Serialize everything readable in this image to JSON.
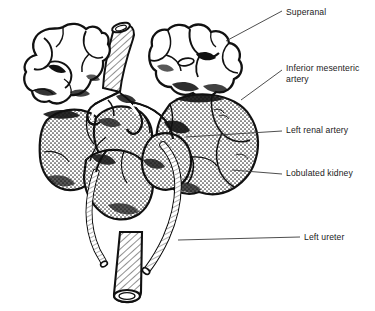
{
  "figure": {
    "background_color": "#ffffff",
    "ink_color": "#111111",
    "stipple_color": "#3a3a3a"
  },
  "labels": [
    {
      "id": "suprarenal",
      "text": "Superanal",
      "structure": "suprarenal-gland"
    },
    {
      "id": "inferior-mesenteric-artery",
      "text": "Inferior mesenteric\nartery",
      "structure": "inferior-mesenteric-artery"
    },
    {
      "id": "left-renal-artery",
      "text": "Left renal artery",
      "structure": "left-renal-artery"
    },
    {
      "id": "lobulated-kidney",
      "text": "Lobulated kidney",
      "structure": "lobulated-kidney"
    },
    {
      "id": "left-ureter",
      "text": "Left ureter",
      "structure": "left-ureter"
    }
  ],
  "structures": [
    {
      "id": "left-suprarenal-gland",
      "name": "Left suprarenal gland",
      "fill": "white",
      "texture": "none"
    },
    {
      "id": "right-suprarenal-gland",
      "name": "Right suprarenal gland",
      "fill": "white",
      "texture": "none"
    },
    {
      "id": "left-kidney",
      "name": "Left lobulated kidney",
      "fill": "stipple",
      "texture": "stipple"
    },
    {
      "id": "right-kidney",
      "name": "Right lobulated kidney",
      "fill": "stipple",
      "texture": "stipple"
    },
    {
      "id": "aorta",
      "name": "Abdominal aorta",
      "fill": "white",
      "texture": "hatch"
    },
    {
      "id": "left-ureter-tube",
      "name": "Left ureter",
      "fill": "white",
      "texture": "hatch"
    },
    {
      "id": "right-ureter-tube",
      "name": "Right ureter",
      "fill": "white",
      "texture": "hatch"
    },
    {
      "id": "renal-arteries",
      "name": "Renal arteries",
      "fill": "white",
      "texture": "none"
    }
  ]
}
